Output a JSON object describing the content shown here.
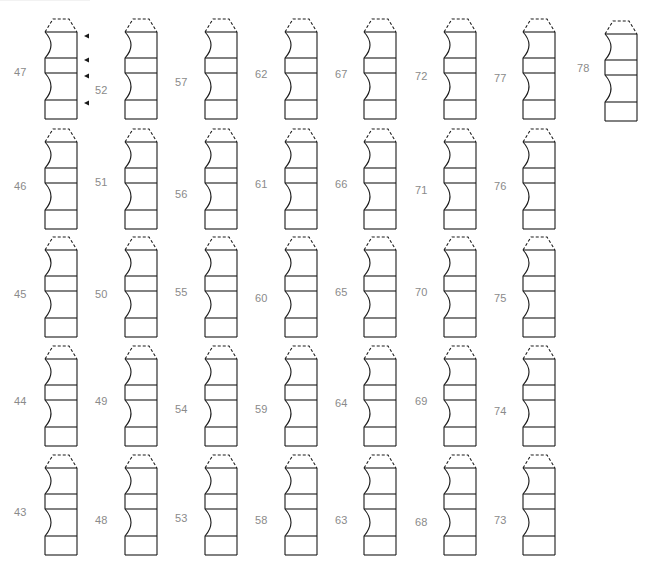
{
  "figure": {
    "stroke_color": "#1a1a1a",
    "label_color": "#8a8a8a",
    "columns": [
      {
        "x": 44,
        "label_x": 14,
        "items": [
          {
            "n": "47",
            "y": 18,
            "label_dy": 48,
            "arrows": true
          },
          {
            "n": "46",
            "y": 128,
            "label_dy": 52
          },
          {
            "n": "45",
            "y": 236,
            "label_dy": 52
          },
          {
            "n": "44",
            "y": 345,
            "label_dy": 50
          },
          {
            "n": "43",
            "y": 454,
            "label_dy": 52
          }
        ]
      },
      {
        "x": 124,
        "label_x": 95,
        "items": [
          {
            "n": "52",
            "y": 18,
            "label_dy": 66
          },
          {
            "n": "51",
            "y": 128,
            "label_dy": 48
          },
          {
            "n": "50",
            "y": 236,
            "label_dy": 52
          },
          {
            "n": "49",
            "y": 345,
            "label_dy": 50
          },
          {
            "n": "48",
            "y": 454,
            "label_dy": 60
          }
        ]
      },
      {
        "x": 204,
        "label_x": 175,
        "items": [
          {
            "n": "57",
            "y": 18,
            "label_dy": 58
          },
          {
            "n": "56",
            "y": 128,
            "label_dy": 60
          },
          {
            "n": "55",
            "y": 236,
            "label_dy": 50
          },
          {
            "n": "54",
            "y": 345,
            "label_dy": 58
          },
          {
            "n": "53",
            "y": 454,
            "label_dy": 58
          }
        ]
      },
      {
        "x": 284,
        "label_x": 255,
        "items": [
          {
            "n": "62",
            "y": 18,
            "label_dy": 50
          },
          {
            "n": "61",
            "y": 128,
            "label_dy": 50
          },
          {
            "n": "60",
            "y": 236,
            "label_dy": 56
          },
          {
            "n": "59",
            "y": 345,
            "label_dy": 58
          },
          {
            "n": "58",
            "y": 454,
            "label_dy": 60
          }
        ]
      },
      {
        "x": 363,
        "label_x": 335,
        "items": [
          {
            "n": "67",
            "y": 18,
            "label_dy": 50
          },
          {
            "n": "66",
            "y": 128,
            "label_dy": 50
          },
          {
            "n": "65",
            "y": 236,
            "label_dy": 50
          },
          {
            "n": "64",
            "y": 345,
            "label_dy": 52
          },
          {
            "n": "63",
            "y": 454,
            "label_dy": 60
          }
        ]
      },
      {
        "x": 443,
        "label_x": 415,
        "items": [
          {
            "n": "72",
            "y": 18,
            "label_dy": 52
          },
          {
            "n": "71",
            "y": 128,
            "label_dy": 56
          },
          {
            "n": "70",
            "y": 236,
            "label_dy": 50
          },
          {
            "n": "69",
            "y": 345,
            "label_dy": 50
          },
          {
            "n": "68",
            "y": 454,
            "label_dy": 62
          }
        ]
      },
      {
        "x": 522,
        "label_x": 494,
        "items": [
          {
            "n": "77",
            "y": 18,
            "label_dy": 54
          },
          {
            "n": "76",
            "y": 128,
            "label_dy": 52
          },
          {
            "n": "75",
            "y": 236,
            "label_dy": 56
          },
          {
            "n": "74",
            "y": 345,
            "label_dy": 60
          },
          {
            "n": "73",
            "y": 454,
            "label_dy": 60
          }
        ]
      },
      {
        "x": 604,
        "label_x": 577,
        "items": [
          {
            "n": "78",
            "y": 20,
            "label_dy": 42
          }
        ]
      }
    ]
  }
}
